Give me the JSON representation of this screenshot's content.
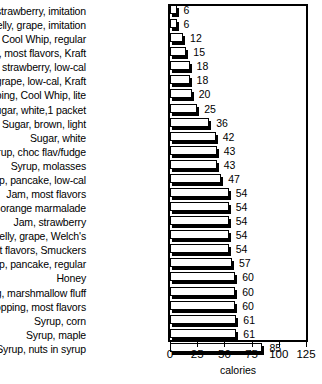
{
  "chart_data": {
    "type": "bar",
    "orientation": "horizontal",
    "title": "",
    "xlabel": "calories",
    "ylabel": "",
    "xlim": [
      0,
      125
    ],
    "xticks": [
      0,
      25,
      50,
      75,
      100,
      125
    ],
    "grid": false,
    "legend": null,
    "categories": [
      "Jam, strawberry, imitation",
      "Jelly, grape, imitation",
      "Topping, Cool Whip, regular",
      "Jelly, most flavors, Kraft",
      "Jam, strawberry, low-cal",
      "Jelly, grape, low-cal, Kraft",
      "Topping, Cool Whip, lite",
      "Sugar, white,1 packet",
      "Sugar, brown, light",
      "Sugar, white",
      "Syrup, choc flav/fudge",
      "Syrup, molasses",
      "Syrup, pancake, low-cal",
      "Jam, most flavors",
      "Jam, orange marmalade",
      "Jam, strawberry",
      "Jelly, grape, Welch's",
      "Jelly, most flavors, Smuckers",
      "Syrup, pancake, regular",
      "Honey",
      "Topping, marshmallow fluff",
      "Topping, most flavors",
      "Syrup, corn",
      "Syrup, maple",
      "Syrup, nuts in syrup"
    ],
    "values": [
      6,
      6,
      12,
      15,
      18,
      18,
      20,
      25,
      36,
      42,
      43,
      43,
      47,
      54,
      54,
      54,
      54,
      54,
      57,
      60,
      60,
      60,
      61,
      61,
      85
    ],
    "value_labels": [
      "6",
      "6",
      "12",
      "15",
      "18",
      "18",
      "20",
      "25",
      "36",
      "42",
      "43",
      "43",
      "47",
      "54",
      "54",
      "54",
      "54",
      "54",
      "57",
      "60",
      "60",
      "60",
      "61",
      "61",
      "85"
    ],
    "tick_labels": [
      "0",
      "25",
      "50",
      "75",
      "100",
      "125"
    ],
    "colors": {
      "bar_fill": "#ffffff",
      "bar_outline": "#000000",
      "bar_shadow": "#000000",
      "axis": "#000000",
      "text": "#000000",
      "background": "#ffffff"
    }
  }
}
